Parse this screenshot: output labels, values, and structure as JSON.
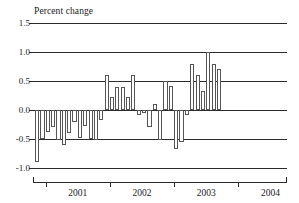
{
  "chart_data": {
    "type": "bar",
    "title": "Percent change",
    "xlabel": "",
    "ylabel": "Percent change",
    "ylim": [
      -1.0,
      1.5
    ],
    "yticks": [
      1.5,
      1.0,
      0.5,
      0.0,
      -0.5,
      -1.0
    ],
    "ytick_labels": [
      "1.5",
      "1.0",
      "0.5",
      "0.0",
      "-0.5",
      "-1.0"
    ],
    "xtick_labels": [
      "2001",
      "2002",
      "2003",
      "2004"
    ],
    "grid": true,
    "legend": "none",
    "zero_line": 0.0,
    "categories": [
      "2000-11",
      "2000-12",
      "2001-01",
      "2001-02",
      "2001-03",
      "2001-04",
      "2001-05",
      "2001-06",
      "2001-07",
      "2001-08",
      "2001-09",
      "2001-10",
      "2001-11",
      "2001-12",
      "2002-01",
      "2002-02",
      "2002-03",
      "2002-04",
      "2002-05",
      "2002-06",
      "2002-07",
      "2002-08",
      "2002-09",
      "2002-10",
      "2002-11",
      "2002-12",
      "2003-01",
      "2003-02",
      "2003-03",
      "2003-04",
      "2003-05",
      "2003-06",
      "2003-07",
      "2003-08",
      "2003-09",
      "2003-10",
      "2003-11",
      "2003-12"
    ],
    "values": [
      -0.9,
      -0.5,
      -0.38,
      -0.3,
      -0.52,
      -0.6,
      -0.4,
      -0.2,
      -0.48,
      -0.28,
      -0.5,
      -0.52,
      -0.18,
      0.6,
      0.22,
      0.4,
      0.4,
      0.22,
      0.6,
      -0.08,
      -0.05,
      -0.3,
      0.1,
      -0.52,
      0.5,
      0.42,
      -0.68,
      -0.55,
      -0.08,
      0.8,
      0.6,
      0.32,
      1.0,
      0.8,
      0.7,
      0.0,
      0.0,
      0.0
    ]
  }
}
